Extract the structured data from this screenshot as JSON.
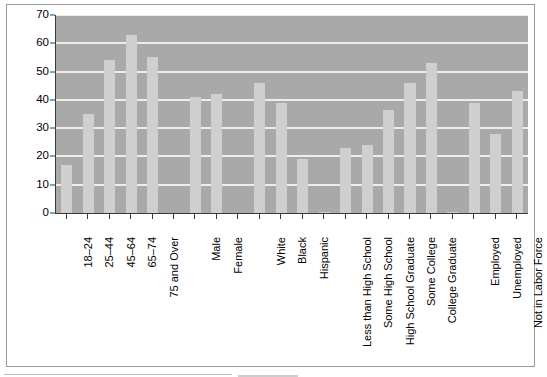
{
  "chart_data": {
    "type": "bar",
    "title": "",
    "xlabel": "",
    "ylabel": "",
    "ylim": [
      0,
      70
    ],
    "ytick_values": [
      0,
      10,
      20,
      30,
      40,
      50,
      60,
      70
    ],
    "ytick_labels": [
      "0",
      "10",
      "20",
      "30",
      "40",
      "50",
      "60",
      "70"
    ],
    "grid": true,
    "legend": "none",
    "orientation": "vertical",
    "bar_color": "#cfcfcf",
    "plot_background": "#a9a9a9",
    "gridline_color": "#ededed",
    "axis_color": "#3a3a3a",
    "categories": [
      "18–24",
      "25–44",
      "45–64",
      "65–74",
      "75 and Over",
      "",
      "Male",
      "Female",
      "",
      "White",
      "Black",
      "Hispanic",
      "",
      "Less than High School",
      "Some High School",
      "High School Graduate",
      "Some College",
      "College Graduate",
      "",
      "Employed",
      "Unemployed",
      "Not in Labor Force"
    ],
    "values": [
      17,
      35,
      54,
      63,
      55,
      0,
      41,
      42,
      0,
      46,
      39,
      19,
      0.5,
      23,
      24,
      36.5,
      46,
      53,
      0.5,
      39,
      28,
      43
    ],
    "groups": [
      {
        "name": "Age",
        "categories": [
          "18–24",
          "25–44",
          "45–64",
          "65–74",
          "75 and Over"
        ],
        "values": [
          17,
          35,
          54,
          63,
          55
        ]
      },
      {
        "name": "Sex",
        "categories": [
          "Male",
          "Female"
        ],
        "values": [
          41,
          42
        ]
      },
      {
        "name": "Race/Ethnicity",
        "categories": [
          "White",
          "Black",
          "Hispanic"
        ],
        "values": [
          46,
          39,
          19
        ]
      },
      {
        "name": "Education",
        "categories": [
          "Less than High School",
          "Some High School",
          "High School Graduate",
          "Some College",
          "College Graduate"
        ],
        "values": [
          23,
          24,
          36.5,
          46,
          53
        ]
      },
      {
        "name": "Employment Status",
        "categories": [
          "Employed",
          "Unemployed",
          "Not in Labor Force"
        ],
        "values": [
          39,
          28,
          43
        ]
      }
    ]
  }
}
